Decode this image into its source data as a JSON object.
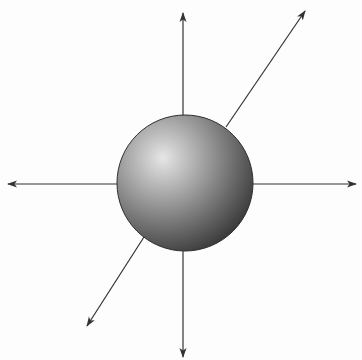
{
  "diagram": {
    "background_color": "#fdfdfd",
    "line_color": "#333333",
    "sphere": {
      "cx": 185,
      "cy": 183,
      "r": 68,
      "highlight": {
        "x": 163,
        "y": 158
      },
      "colors": {
        "highlight": "#e6e6e6",
        "mid": "#9a9a9a",
        "shadow": "#3c3c3c",
        "edge": "#2e2e2e"
      }
    },
    "arrows": [
      {
        "id": "up",
        "from": [
          183,
          116
        ],
        "to": [
          183,
          13
        ]
      },
      {
        "id": "down",
        "from": [
          183,
          251
        ],
        "to": [
          183,
          357
        ]
      },
      {
        "id": "left",
        "from": [
          117,
          184
        ],
        "to": [
          8,
          184
        ]
      },
      {
        "id": "right",
        "from": [
          253,
          184
        ],
        "to": [
          356,
          184
        ]
      },
      {
        "id": "up-right",
        "from": [
          226,
          127
        ],
        "to": [
          305,
          11
        ]
      },
      {
        "id": "down-left",
        "from": [
          144,
          237
        ],
        "to": [
          87,
          326
        ]
      }
    ]
  }
}
